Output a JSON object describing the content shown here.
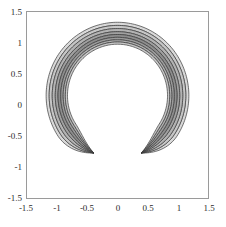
{
  "figure": {
    "background_color": "#ffffff",
    "frame_color": "#9a9a9a",
    "width": 226,
    "height": 227
  },
  "axes": {
    "frame": {
      "left": 26,
      "top": 11,
      "right": 209,
      "bottom": 199
    },
    "x_ticks": [
      "-1.5",
      "-1",
      "-0.5",
      "0",
      "0.5",
      "1",
      "1.5"
    ],
    "x_tick_values": [
      -1.5,
      -1,
      -0.5,
      0,
      0.5,
      1,
      1.5
    ],
    "y_ticks": [
      "1.5",
      "1",
      "0.5",
      "0",
      "-0.5",
      "-1",
      "-1.5"
    ],
    "y_tick_values": [
      1.5,
      1,
      0.5,
      0,
      -0.5,
      -1,
      -1.5
    ],
    "xlim": [
      -1.5,
      1.5
    ],
    "ylim": [
      -1.5,
      1.5
    ],
    "xlabel": "",
    "ylabel": "",
    "title": "",
    "grid": false,
    "ticks_visible": false
  },
  "chart_data": {
    "type": "contour",
    "title": "",
    "xlabel": "",
    "ylabel": "",
    "xlim": [
      -1.5,
      1.5
    ],
    "ylim": [
      -1.5,
      1.5
    ],
    "grid": false,
    "legend": null,
    "filled": true,
    "shape": "crescent annulus open at bottom",
    "center": [
      0.0,
      0.15
    ],
    "gap_start_deg": 247,
    "gap_end_deg": 293,
    "tip_points": [
      [
        -0.45,
        -0.9
      ],
      [
        0.45,
        -0.9
      ]
    ],
    "contour_line_color": "#3a3a3a",
    "contour_line_width": 0.7,
    "levels": [
      {
        "index": 0,
        "r_outer": 1.17,
        "r_inner": 1.12,
        "fill": "#d9d9d9",
        "label": "level-1"
      },
      {
        "index": 1,
        "r_outer": 1.12,
        "r_inner": 1.07,
        "fill": "#c6c6c6",
        "label": "level-2"
      },
      {
        "index": 2,
        "r_outer": 1.07,
        "r_inner": 1.02,
        "fill": "#b3b3b3",
        "label": "level-3"
      },
      {
        "index": 3,
        "r_outer": 1.02,
        "r_inner": 0.975,
        "fill": "#a0a0a0",
        "label": "level-4"
      },
      {
        "index": 4,
        "r_outer": 0.975,
        "r_inner": 0.93,
        "fill": "#8d8d8d",
        "label": "level-5"
      },
      {
        "index": 5,
        "r_outer": 0.93,
        "r_inner": 0.89,
        "fill": "#9a9a9a",
        "label": "level-6"
      },
      {
        "index": 6,
        "r_outer": 0.89,
        "r_inner": 0.855,
        "fill": "#b0b0b0",
        "label": "level-7"
      },
      {
        "index": 7,
        "r_outer": 0.855,
        "r_inner": 0.82,
        "fill": "#c9c9c9",
        "label": "level-8"
      }
    ],
    "inner_hole_fill": "#ffffff"
  }
}
